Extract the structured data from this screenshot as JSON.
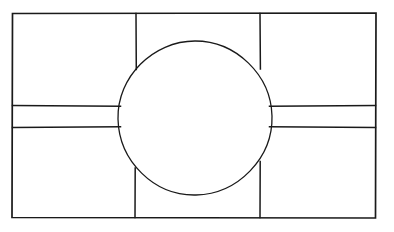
{
  "document": {
    "title": "Technical Line Drawing",
    "description": "Hand-drawn orthographic line diagram: a large outer rectangle subdivided into four corner rectangular panels by two vertical and two horizontal interior lines, with a large circle centered in the middle where the interior lines terminate at its circumference.",
    "style": "hand-drawn ink line art",
    "background_color": "#ffffff",
    "ink_color": "#1a1a1a"
  },
  "canvas": {
    "width": 394,
    "height": 232
  },
  "chart_data": {
    "type": "diagram",
    "xlabel": "",
    "ylabel": "",
    "grid": false,
    "legend": "none",
    "xlim": [
      0,
      394
    ],
    "ylim": [
      0,
      232
    ],
    "shapes": [
      {
        "name": "outer-rectangle",
        "kind": "rect",
        "x": 12,
        "y": 13,
        "width": 364,
        "height": 205,
        "stroke_width": 1.7
      },
      {
        "name": "center-circle",
        "kind": "circle",
        "cx": 195,
        "cy": 118,
        "r": 77,
        "stroke_width": 1.3
      },
      {
        "name": "upper-left-divider",
        "kind": "line",
        "x1": 136,
        "y1": 13,
        "x2": 136,
        "y2": 69,
        "stroke_width": 1.5
      },
      {
        "name": "upper-right-divider",
        "kind": "line",
        "x1": 260,
        "y1": 13,
        "x2": 260,
        "y2": 69,
        "stroke_width": 1.5
      },
      {
        "name": "lower-left-divider",
        "kind": "line",
        "x1": 135,
        "y1": 168,
        "x2": 135,
        "y2": 218,
        "stroke_width": 1.5
      },
      {
        "name": "lower-right-divider",
        "kind": "line",
        "x1": 260,
        "y1": 162,
        "x2": 260,
        "y2": 218,
        "stroke_width": 1.5
      },
      {
        "name": "left-upper-horizontal",
        "kind": "line",
        "x1": 12,
        "y1": 106,
        "x2": 120,
        "y2": 106,
        "stroke_width": 1.5
      },
      {
        "name": "left-lower-horizontal",
        "kind": "line",
        "x1": 12,
        "y1": 127,
        "x2": 120,
        "y2": 127,
        "stroke_width": 1.5
      },
      {
        "name": "right-upper-horizontal",
        "kind": "line",
        "x1": 270,
        "y1": 106,
        "x2": 376,
        "y2": 106,
        "stroke_width": 1.5
      },
      {
        "name": "right-lower-horizontal",
        "kind": "line",
        "x1": 270,
        "y1": 127,
        "x2": 376,
        "y2": 127,
        "stroke_width": 1.5
      }
    ],
    "regions": [
      {
        "name": "top-left-panel",
        "label": ""
      },
      {
        "name": "top-center-panel",
        "label": ""
      },
      {
        "name": "top-right-panel",
        "label": ""
      },
      {
        "name": "bottom-left-panel",
        "label": ""
      },
      {
        "name": "bottom-center-panel",
        "label": ""
      },
      {
        "name": "bottom-right-panel",
        "label": ""
      },
      {
        "name": "center-circle-region",
        "label": ""
      }
    ],
    "annotations": []
  }
}
